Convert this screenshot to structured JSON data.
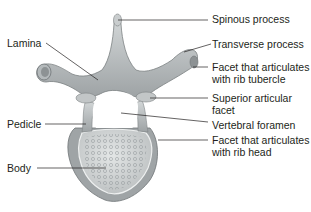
{
  "figure": {
    "labels": {
      "spinous_process": "Spinous process",
      "transverse_process": "Transverse process",
      "facet_rib_tubercle_line1": "Facet that articulates",
      "facet_rib_tubercle_line2": "with rib tubercle",
      "superior_articular_facet_line1": "Superior articular",
      "superior_articular_facet_line2": "facet",
      "vertebral_foramen": "Vertebral foramen",
      "facet_rib_head_line1": "Facet that articulates",
      "facet_rib_head_line2": "with rib head",
      "lamina": "Lamina",
      "pedicle": "Pedicle",
      "body": "Body"
    },
    "colors": {
      "bone_light": "#cfd3d4",
      "bone_mid": "#a9aeb0",
      "bone_dark": "#7f8486",
      "leader_line": "#231f20",
      "text": "#231f20"
    }
  }
}
